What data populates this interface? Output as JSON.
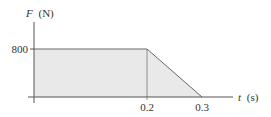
{
  "chart_data": {
    "type": "area",
    "title": "",
    "xlabel": "t (s)",
    "ylabel": "F (N)",
    "xlabel_var": "t",
    "xlabel_unit": "(s)",
    "ylabel_var": "F",
    "ylabel_unit": "(N)",
    "x": [
      0,
      0.2,
      0.3
    ],
    "y": [
      800,
      800,
      0
    ],
    "series": [
      {
        "name": "F(t)",
        "x": [
          0,
          0.2,
          0.3
        ],
        "values": [
          800,
          800,
          0
        ]
      }
    ],
    "x_ticks": [
      "0.2",
      "0.3"
    ],
    "y_ticks": [
      "800"
    ],
    "xlim": [
      0,
      0.4
    ],
    "ylim": [
      0,
      1000
    ],
    "grid": false,
    "legend": null,
    "annotations": [
      "vertical guide line at t = 0.2"
    ]
  },
  "colors": {
    "axis": "#555555",
    "fill": "#e9e9e9",
    "line": "#666666",
    "text": "#333333"
  }
}
